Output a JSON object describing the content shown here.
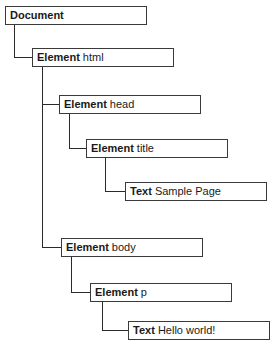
{
  "nodes": [
    {
      "id": "document",
      "kind": "Document",
      "name": ""
    },
    {
      "id": "html",
      "kind": "Element",
      "name": "html"
    },
    {
      "id": "head",
      "kind": "Element",
      "name": "head"
    },
    {
      "id": "title",
      "kind": "Element",
      "name": "title"
    },
    {
      "id": "text-title",
      "kind": "Text",
      "name": "Sample Page"
    },
    {
      "id": "body",
      "kind": "Element",
      "name": "body"
    },
    {
      "id": "p",
      "kind": "Element",
      "name": "p"
    },
    {
      "id": "text-p",
      "kind": "Text",
      "name": "Hello world!"
    }
  ]
}
